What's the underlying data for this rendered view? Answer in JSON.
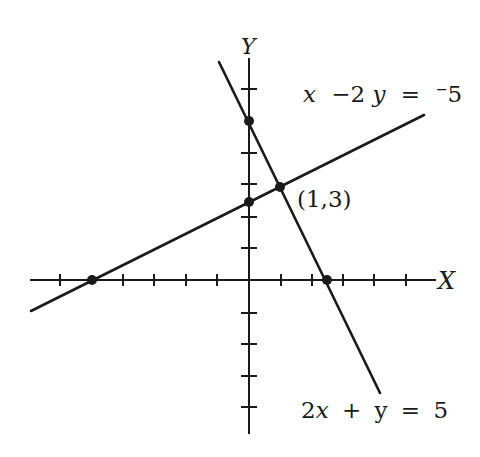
{
  "diagram": {
    "type": "coordinate-graph",
    "axes": {
      "x_label": "X",
      "y_label": "Y",
      "x_ticks": [
        -6,
        -5,
        -4,
        -3,
        -2,
        -1,
        1,
        2,
        3,
        4,
        5
      ],
      "y_ticks": [
        6,
        5,
        4,
        3,
        2,
        1,
        -1,
        -2,
        -3,
        -4,
        -5
      ],
      "origin_px": [
        249,
        280
      ],
      "unit_px": 31.3
    },
    "lines": [
      {
        "equation": "x −2y = ⁻5",
        "label_parts": {
          "a": "x",
          "op1": "−2",
          "b": "y",
          "eq": "=",
          "rhs": "⁻5"
        },
        "x_intercept": [
          -5,
          0
        ],
        "y_intercept": [
          0,
          2.5
        ]
      },
      {
        "equation": "2x + y = 5",
        "label_parts": {
          "a": "2",
          "b": "x",
          "op1": "+",
          "c": "y",
          "eq": "=",
          "rhs": "5"
        },
        "x_intercept": [
          2.5,
          0
        ],
        "y_intercept": [
          0,
          5
        ]
      }
    ],
    "intersection": {
      "label": "(1,3)",
      "point": [
        1,
        3
      ]
    },
    "colors": {
      "ink": "#1a1a1a",
      "background": "#ffffff"
    }
  }
}
